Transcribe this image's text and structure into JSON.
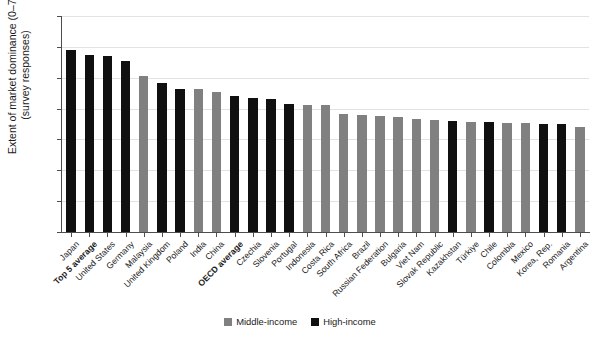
{
  "chart": {
    "type": "bar",
    "ylabel_line1": "Extent of market dominance (0–7)",
    "ylabel_line2": "(survey responses)"
  },
  "legend": {
    "position": "bottom-center",
    "items": [
      {
        "label": "Middle-income",
        "color": "#808080",
        "key": "middle"
      },
      {
        "label": "High-income",
        "color": "#101010",
        "key": "high"
      }
    ]
  },
  "yaxis": {
    "ticks": [
      "0",
      "1",
      "2",
      "3",
      "4",
      "5",
      "6",
      "7"
    ],
    "min": 0,
    "max": 7
  },
  "chart_data": {
    "type": "bar",
    "title": "",
    "subtitle": "",
    "xlabel": "",
    "ylabel": "Extent of market dominance (0–7) (survey responses)",
    "ylim": [
      0,
      7
    ],
    "yticks": [
      0,
      1,
      2,
      3,
      4,
      5,
      6,
      7
    ],
    "grid": true,
    "legend_position": "bottom-center",
    "legend": [
      "Middle-income",
      "High-income"
    ],
    "group_colors": {
      "Middle-income": "#808080",
      "High-income": "#101010"
    },
    "categories": [
      "Japan",
      "Top 5 average",
      "United States",
      "Germany",
      "Malaysia",
      "United Kingdom",
      "Poland",
      "India",
      "China",
      "OECD average",
      "Czechia",
      "Slovenia",
      "Portugal",
      "Indonesia",
      "Costa Rica",
      "South Africa",
      "Brazil",
      "Russian Federation",
      "Bulgaria",
      "Viet Nam",
      "Slovak Republic",
      "Kazakhstan",
      "Türkiye",
      "Chile",
      "Colombia",
      "Mexico",
      "Korea, Rep.",
      "Romania",
      "Argentina"
    ],
    "values": [
      5.9,
      5.73,
      5.71,
      5.55,
      5.05,
      4.82,
      4.65,
      4.64,
      4.54,
      4.4,
      4.35,
      4.31,
      4.15,
      4.13,
      4.11,
      3.83,
      3.8,
      3.76,
      3.73,
      3.66,
      3.64,
      3.59,
      3.57,
      3.55,
      3.54,
      3.52,
      3.51,
      3.5,
      3.4
    ],
    "groups": [
      "High-income",
      "High-income",
      "High-income",
      "High-income",
      "Middle-income",
      "High-income",
      "High-income",
      "Middle-income",
      "Middle-income",
      "High-income",
      "High-income",
      "High-income",
      "High-income",
      "Middle-income",
      "Middle-income",
      "Middle-income",
      "Middle-income",
      "Middle-income",
      "Middle-income",
      "Middle-income",
      "Middle-income",
      "High-income",
      "Middle-income",
      "High-income",
      "Middle-income",
      "Middle-income",
      "High-income",
      "High-income",
      "Middle-income"
    ],
    "bold_categories": [
      "Top 5 average",
      "OECD average"
    ]
  }
}
